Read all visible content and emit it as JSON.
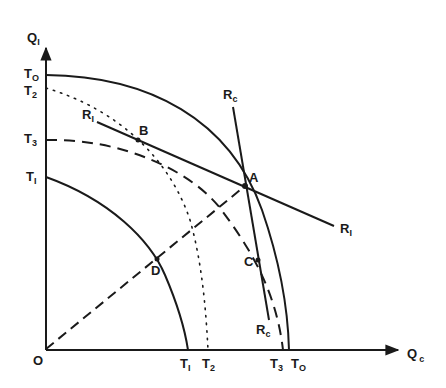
{
  "diagram": {
    "axes": {
      "y_label": "Q",
      "y_label_sub": "I",
      "x_label": "Q",
      "x_label_sub": "c",
      "origin_label": "O"
    },
    "y_ticks": [
      {
        "main": "T",
        "sub": "O"
      },
      {
        "main": "T",
        "sub": "2"
      },
      {
        "main": "T",
        "sub": "3"
      },
      {
        "main": "T",
        "sub": "I"
      }
    ],
    "x_ticks": [
      {
        "main": "T",
        "sub": "I"
      },
      {
        "main": "T",
        "sub": "2"
      },
      {
        "main": "T",
        "sub": "3"
      },
      {
        "main": "T",
        "sub": "O"
      }
    ],
    "lines": {
      "r_i": {
        "main": "R",
        "sub": "I"
      },
      "r_i_end": {
        "main": "R",
        "sub": "I"
      },
      "r_c_top": {
        "main": "R",
        "sub": "c"
      },
      "r_c_bottom": {
        "main": "R",
        "sub": "c"
      }
    },
    "points": {
      "a": "A",
      "b": "B",
      "c": "C",
      "d": "D"
    },
    "colors": {
      "ink": "#1a1a1a",
      "background": "#ffffff"
    }
  }
}
